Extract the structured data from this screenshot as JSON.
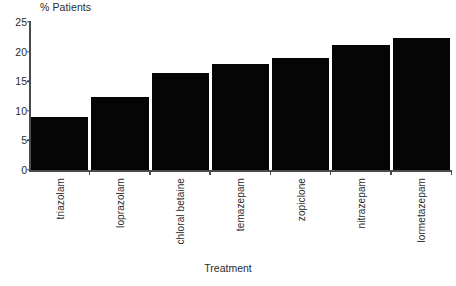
{
  "chart_data": {
    "type": "bar",
    "title": "% Patients",
    "xlabel": "Treatment",
    "ylabel": "% Patients",
    "categories": [
      "triazolam",
      "loprazolam",
      "chloral betaine",
      "temazepam",
      "zopiclone",
      "nitrazepam",
      "lormetazepam"
    ],
    "values": [
      9.0,
      12.3,
      16.4,
      17.9,
      18.9,
      21.1,
      22.3
    ],
    "ylim": [
      0,
      25
    ],
    "ytick_labels": [
      "0",
      "5",
      "10",
      "15",
      "20",
      "25"
    ],
    "ytick_values": [
      0,
      5,
      10,
      15,
      20,
      25
    ],
    "grid": false,
    "legend": false,
    "bar_color": "#050505",
    "axis_color": "#4a4a4a",
    "background_color": "#ffffff"
  }
}
